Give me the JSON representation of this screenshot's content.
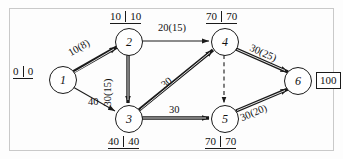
{
  "diagram": {
    "type": "activity-on-arrow-network",
    "nodes": [
      {
        "id": "1",
        "label": "1",
        "x": 62,
        "y": 79
      },
      {
        "id": "2",
        "label": "2",
        "x": 128,
        "y": 41
      },
      {
        "id": "3",
        "label": "3",
        "x": 128,
        "y": 118
      },
      {
        "id": "4",
        "label": "4",
        "x": 224,
        "y": 41
      },
      {
        "id": "5",
        "label": "5",
        "x": 224,
        "y": 118
      },
      {
        "id": "6",
        "label": "6",
        "x": 297,
        "y": 80
      }
    ],
    "edges": [
      {
        "from": "1",
        "to": "2",
        "label": "10(8)",
        "style": "bold",
        "label_x": 72,
        "label_y": 48,
        "rotate": -30
      },
      {
        "from": "1",
        "to": "3",
        "label": "40",
        "style": "thin",
        "label_x": 88,
        "label_y": 97,
        "rotate": 0
      },
      {
        "from": "2",
        "to": "4",
        "label": "20(15)",
        "style": "thin",
        "label_x": 158,
        "label_y": 23,
        "rotate": 0
      },
      {
        "from": "2",
        "to": "3",
        "label": "30(15)",
        "style": "bold",
        "label_x": 113,
        "label_y": 80,
        "rotate": -90
      },
      {
        "from": "3",
        "to": "4",
        "label": "30",
        "style": "bold",
        "label_x": 169,
        "label_y": 73,
        "rotate": -38
      },
      {
        "from": "3",
        "to": "5",
        "label": "30",
        "style": "bold",
        "label_x": 169,
        "label_y": 105,
        "rotate": 0
      },
      {
        "from": "4",
        "to": "5",
        "label": "",
        "style": "dashed",
        "label_x": 0,
        "label_y": 0,
        "rotate": 0
      },
      {
        "from": "4",
        "to": "6",
        "label": "30(25)",
        "style": "bold",
        "label_x": 248,
        "label_y": 42,
        "rotate": 30
      },
      {
        "from": "5",
        "to": "6",
        "label": "30(20)",
        "style": "bold",
        "label_x": 245,
        "label_y": 110,
        "rotate": -28
      }
    ],
    "time_labels": [
      {
        "node": "1",
        "early": "0",
        "late": "0",
        "x": 13,
        "y": 72,
        "position": "left"
      },
      {
        "node": "2",
        "early": "10",
        "late": "10",
        "x": 110,
        "y": 14,
        "position": "above"
      },
      {
        "node": "4",
        "early": "70",
        "late": "70",
        "x": 206,
        "y": 14,
        "position": "above"
      },
      {
        "node": "3",
        "early": "40",
        "late": "40",
        "x": 108,
        "y": 137,
        "position": "below"
      },
      {
        "node": "5",
        "early": "70",
        "late": "70",
        "x": 205,
        "y": 137,
        "position": "below"
      }
    ],
    "terminal": {
      "label": "100",
      "x": 318,
      "y": 80
    }
  }
}
